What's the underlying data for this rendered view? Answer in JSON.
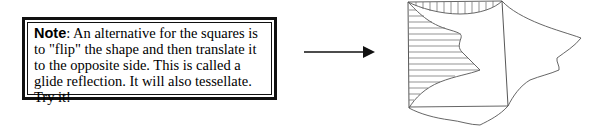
{
  "note": {
    "label": "Note",
    "separator": ":",
    "text": " An alternative for the squares is to \"flip\" the shape and then translate it to the opposite side. This is called a glide reflection. It will also tessellate. Try it!"
  },
  "arrow": {
    "icon": "right-arrow-icon",
    "direction": "right"
  },
  "figure": {
    "line_color": "#444444"
  }
}
